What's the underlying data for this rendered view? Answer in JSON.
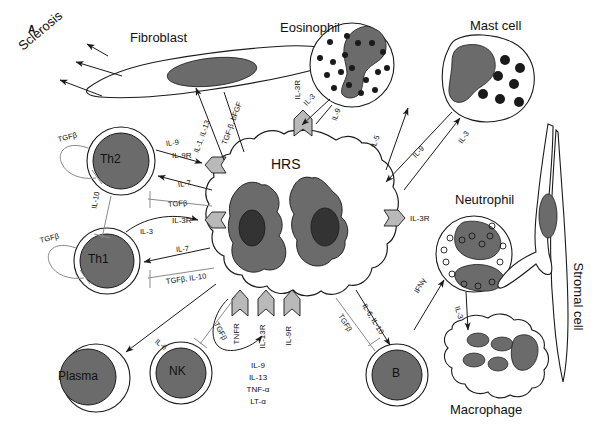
{
  "figure": {
    "panel_label": "A",
    "width": 594,
    "height": 435,
    "background": "#ffffff"
  },
  "colors": {
    "outline": "#1a1a1a",
    "nucleus_gray": "#6b6b6b",
    "nucleolus_dark": "#333333",
    "receptor_gray": "#b9b9b9",
    "granule_dark": "#1a1a1a",
    "text": "#111111",
    "inhibit_line": "#8a8a8a"
  },
  "cells": {
    "hrs": {
      "name": "HRS",
      "label_inside": "HRS"
    },
    "fibroblast": {
      "name": "Fibroblast"
    },
    "eosinophil": {
      "name": "Eosinophil"
    },
    "mast": {
      "name": "Mast cell"
    },
    "neutrophil": {
      "name": "Neutrophil"
    },
    "stromal": {
      "name": "Stromal cell"
    },
    "macrophage": {
      "name": "Macrophage"
    },
    "th2": {
      "name": "Th2",
      "label_inside": "Th2"
    },
    "th1": {
      "name": "Th1",
      "label_inside": "Th1"
    },
    "plasma": {
      "name": "Plasma",
      "label_inside": "Plasma"
    },
    "nk": {
      "name": "NK",
      "label_inside": "NK"
    },
    "bcell": {
      "name": "B",
      "label_inside": "B"
    },
    "sclerosis": {
      "name": "Sclerosis"
    }
  },
  "receptors": [
    {
      "id": "il-9r",
      "label": "IL-9R",
      "location": "hrs-left-upper"
    },
    {
      "id": "il-3r-left",
      "label": "IL-3R",
      "location": "hrs-left-lower"
    },
    {
      "id": "il-3r-top",
      "label": "IL-3R",
      "location": "hrs-top"
    },
    {
      "id": "il-3r-right",
      "label": "IL-3R",
      "location": "hrs-right"
    },
    {
      "id": "tnfr",
      "label": "TNFR",
      "location": "hrs-bottom-1"
    },
    {
      "id": "il-13r",
      "label": "IL-13R",
      "location": "hrs-bottom-2"
    },
    {
      "id": "il-9r-bottom",
      "label": "IL-9R",
      "location": "hrs-bottom-3"
    }
  ],
  "autocrine": {
    "lines": [
      "IL-9",
      "IL-13",
      "TNF-α",
      "LT-α"
    ]
  },
  "edges": [
    {
      "id": "fibro-to-sclerosis-1",
      "label": "",
      "from": "fibroblast",
      "to": "sclerosis",
      "kind": "arrow"
    },
    {
      "id": "fibro-to-sclerosis-2",
      "label": "",
      "from": "fibroblast",
      "to": "sclerosis",
      "kind": "arrow"
    },
    {
      "id": "fibro-to-sclerosis-3",
      "label": "",
      "from": "fibroblast",
      "to": "sclerosis",
      "kind": "arrow"
    },
    {
      "id": "hrs-to-fibro-a",
      "label": "IL-1, IL-13",
      "from": "hrs",
      "to": "fibroblast",
      "kind": "arrow"
    },
    {
      "id": "hrs-to-fibro-b",
      "label": "TGF-β, bFGF",
      "from": "hrs",
      "to": "fibroblast",
      "kind": "arrow"
    },
    {
      "id": "hrs-to-eos",
      "label": "IL-3",
      "from": "hrs",
      "to": "eosinophil",
      "kind": "arrow"
    },
    {
      "id": "eos-to-hrs",
      "label": "IL-9",
      "from": "eosinophil",
      "to": "hrs",
      "kind": "arrow"
    },
    {
      "id": "hrs-to-mast-il5",
      "label": "IL-5",
      "from": "hrs",
      "to": "mast",
      "kind": "arrow"
    },
    {
      "id": "mast-to-hrs-il9",
      "label": "IL-9",
      "from": "mast",
      "to": "hrs",
      "kind": "arrow"
    },
    {
      "id": "hrs-to-mast-il3",
      "label": "IL-3",
      "from": "hrs",
      "to": "mast",
      "kind": "arrow"
    },
    {
      "id": "hrs-to-neut",
      "label": "IFNγ",
      "from": "macrophage",
      "to": "neutrophil",
      "kind": "arrow"
    },
    {
      "id": "hrs-to-macro-il3",
      "label": "IL-3",
      "from": "neutrophil",
      "to": "macrophage",
      "kind": "arrow"
    },
    {
      "id": "hrs-to-b-il6il10",
      "label": "IL-6, IL-10",
      "from": "hrs",
      "to": "bcell",
      "kind": "arrow"
    },
    {
      "id": "hrs-to-b-tgfb",
      "label": "TGFβ",
      "from": "hrs",
      "to": "bcell",
      "kind": "inhibit"
    },
    {
      "id": "th2-to-hrs-il9",
      "label": "IL-9",
      "from": "th2",
      "to": "hrs",
      "kind": "arrow"
    },
    {
      "id": "hrs-to-th2-il7",
      "label": "IL-7",
      "from": "hrs",
      "to": "th2",
      "kind": "arrow"
    },
    {
      "id": "hrs-to-th2-tgfb",
      "label": "TGFβ",
      "from": "hrs",
      "to": "th2",
      "kind": "inhibit"
    },
    {
      "id": "th2-auto-tgfb",
      "label": "TGFβ",
      "from": "th2",
      "to": "th2",
      "kind": "inhibit"
    },
    {
      "id": "th2-to-th1-il10",
      "label": "IL-10",
      "from": "th2",
      "to": "th1",
      "kind": "inhibit"
    },
    {
      "id": "th1-auto-tgfb",
      "label": "TGFβ",
      "from": "th1",
      "to": "th1",
      "kind": "inhibit"
    },
    {
      "id": "th1-to-hrs-il3",
      "label": "IL-3",
      "from": "th1",
      "to": "hrs",
      "kind": "arrow"
    },
    {
      "id": "hrs-to-th1-il7",
      "label": "IL-7",
      "from": "hrs",
      "to": "th1",
      "kind": "arrow"
    },
    {
      "id": "hrs-to-th1-tgfb-il10",
      "label": "TGFβ, IL-10",
      "from": "hrs",
      "to": "th1",
      "kind": "inhibit"
    },
    {
      "id": "hrs-to-plasma-il6",
      "label": "IL-6",
      "from": "hrs",
      "to": "plasma",
      "kind": "arrow"
    },
    {
      "id": "hrs-to-nk-tgfb",
      "label": "TGFβ",
      "from": "hrs",
      "to": "nk",
      "kind": "inhibit"
    }
  ]
}
